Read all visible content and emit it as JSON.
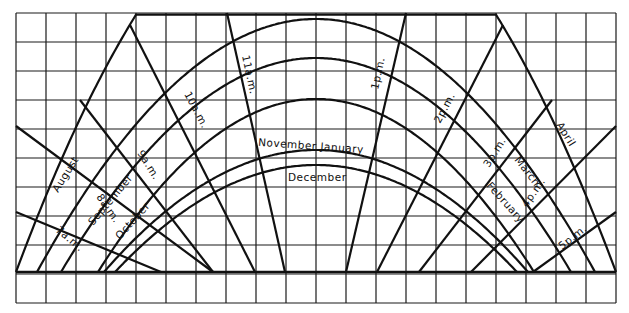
{
  "diagram": {
    "line_color": "#111111",
    "background": "#ffffff",
    "month_labels": {
      "august": "August",
      "september": "September",
      "october": "October",
      "november_january": "November January",
      "december": "December",
      "april": "April",
      "march": "March",
      "february": "February"
    },
    "hour_labels": {
      "h7": "7a.m.",
      "h8": "8a.m.",
      "h9": "9a.m.",
      "h10": "10a.m.",
      "h11": "11a.m.",
      "h13": "1p.m.",
      "h14": "2p.m.",
      "h15": "3p.m.",
      "h16": "4p.m.",
      "h17": "5p.m."
    }
  }
}
